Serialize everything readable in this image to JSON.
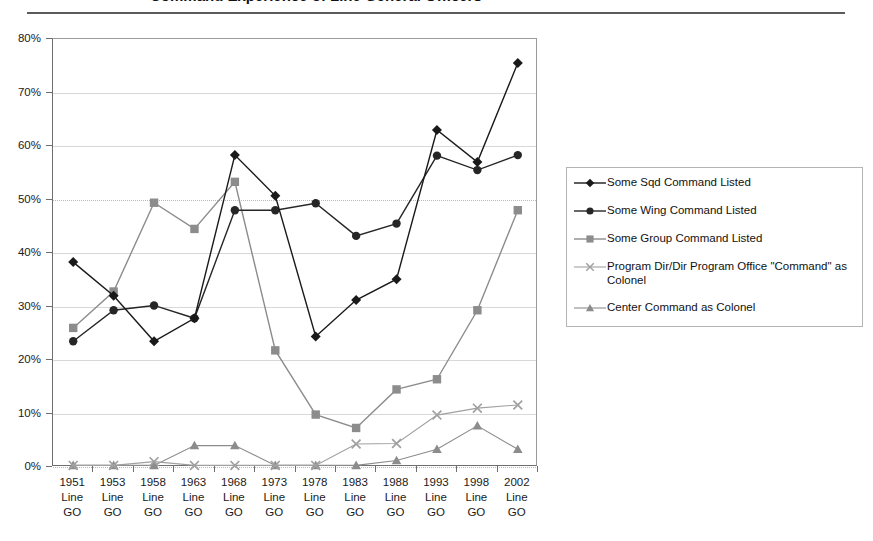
{
  "title": "Command Experience of Line General Officers",
  "chart_data": {
    "type": "line",
    "title": "Command Experience of Line General Officers",
    "xlabel": "",
    "ylabel": "",
    "ylim": [
      0,
      80
    ],
    "yticks": [
      "0%",
      "10%",
      "20%",
      "30%",
      "40%",
      "50%",
      "60%",
      "70%",
      "80%"
    ],
    "ytick_values": [
      0,
      10,
      20,
      30,
      40,
      50,
      60,
      70,
      80
    ],
    "grid": true,
    "legend_position": "right",
    "categories": [
      "1951\nLine\nGO",
      "1953\nLine\nGO",
      "1958\nLine\nGO",
      "1963\nLine\nGO",
      "1968\nLine\nGO",
      "1973\nLine\nGO",
      "1978\nLine\nGO",
      "1983\nLine\nGO",
      "1988\nLine\nGO",
      "1993\nLine\nGO",
      "1998\nLine\nGO",
      "2002\nLine\nGO"
    ],
    "category_labels": [
      {
        "year": "1951",
        "line2": "Line",
        "line3": "GO"
      },
      {
        "year": "1953",
        "line2": "Line",
        "line3": "GO"
      },
      {
        "year": "1958",
        "line2": "Line",
        "line3": "GO"
      },
      {
        "year": "1963",
        "line2": "Line",
        "line3": "GO"
      },
      {
        "year": "1968",
        "line2": "Line",
        "line3": "GO"
      },
      {
        "year": "1973",
        "line2": "Line",
        "line3": "GO"
      },
      {
        "year": "1978",
        "line2": "Line",
        "line3": "GO"
      },
      {
        "year": "1983",
        "line2": "Line",
        "line3": "GO"
      },
      {
        "year": "1988",
        "line2": "Line",
        "line3": "GO"
      },
      {
        "year": "1993",
        "line2": "Line",
        "line3": "GO"
      },
      {
        "year": "1998",
        "line2": "Line",
        "line3": "GO"
      },
      {
        "year": "2002",
        "line2": "Line",
        "line3": "GO"
      }
    ],
    "series": [
      {
        "name": "Some Sqd Command Listed",
        "marker": "diamond",
        "color": "#1a1a1a",
        "values": [
          38.3,
          32.0,
          23.5,
          27.8,
          58.3,
          50.7,
          24.4,
          31.2,
          35.1,
          63.0,
          57.0,
          75.5
        ]
      },
      {
        "name": "Some Wing Command Listed",
        "marker": "circle",
        "color": "#262626",
        "values": [
          23.5,
          29.3,
          30.2,
          27.8,
          48.0,
          48.0,
          49.3,
          43.2,
          45.5,
          58.2,
          55.5,
          58.3
        ]
      },
      {
        "name": "Some Group Command Listed",
        "marker": "square",
        "color": "#8c8c8c",
        "values": [
          26.0,
          32.8,
          49.4,
          44.5,
          53.3,
          21.8,
          9.8,
          7.3,
          14.5,
          16.4,
          29.3,
          48.0
        ]
      },
      {
        "name": "Program Dir/Dir Program Office \"Command\" as Colonel",
        "marker": "cross",
        "color": "#a0a0a0",
        "values": [
          0.3,
          0.3,
          1.0,
          0.3,
          0.3,
          0.3,
          0.3,
          4.3,
          4.4,
          9.7,
          11.0,
          11.6
        ]
      },
      {
        "name": "Center Command as Colonel",
        "marker": "triangle",
        "color": "#8c8c8c",
        "values": [
          0.3,
          0.3,
          0.3,
          4.0,
          4.0,
          0.3,
          0.3,
          0.3,
          1.2,
          3.3,
          7.7,
          3.3
        ]
      }
    ]
  },
  "legend": {
    "items": [
      {
        "label": "Some Sqd Command Listed",
        "marker": "diamond-marker-icon"
      },
      {
        "label": "Some Wing Command Listed",
        "marker": "circle-marker-icon"
      },
      {
        "label": "Some Group Command Listed",
        "marker": "square-marker-icon"
      },
      {
        "label": "Program Dir/Dir Program Office \"Command\" as Colonel",
        "marker": "cross-marker-icon"
      },
      {
        "label": "Center Command as Colonel",
        "marker": "triangle-marker-icon"
      }
    ]
  }
}
